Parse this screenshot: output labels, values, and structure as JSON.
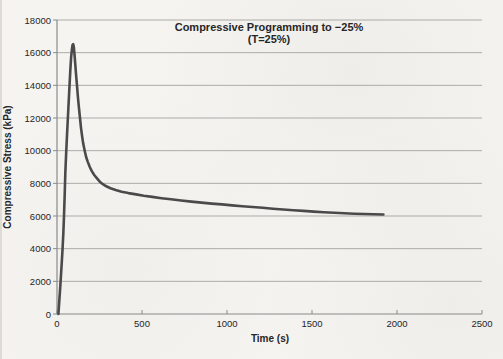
{
  "chart_data": {
    "type": "line",
    "title": "Compressive Programming to −25%",
    "subtitle": "(T=25%)",
    "xlabel": "Time (s)",
    "ylabel": "Compressive Stress (kPa)",
    "xlim": [
      0,
      2500
    ],
    "ylim": [
      0,
      18000
    ],
    "x_ticks": [
      0,
      500,
      1000,
      1500,
      2000,
      2500
    ],
    "y_ticks": [
      0,
      2000,
      4000,
      6000,
      8000,
      10000,
      12000,
      14000,
      16000,
      18000
    ],
    "grid": "horizontal-only",
    "legend": "none",
    "colors": {
      "line": "#4a4a4a",
      "grid": "#adaba8",
      "axis": "#8c8a87",
      "text": "#262626",
      "background": "#f5f4f1"
    },
    "series": [
      {
        "name": "compressive-stress",
        "peak": {
          "time_s": 95,
          "stress_kpa": 16520
        },
        "end": {
          "time_s": 1920,
          "stress_kpa": 6090
        },
        "points": [
          [
            8,
            0
          ],
          [
            14,
            900
          ],
          [
            20,
            1800
          ],
          [
            26,
            2800
          ],
          [
            32,
            3800
          ],
          [
            37,
            4900
          ],
          [
            41,
            6000
          ],
          [
            45,
            7300
          ],
          [
            49,
            8600
          ],
          [
            54,
            9900
          ],
          [
            60,
            11200
          ],
          [
            66,
            12400
          ],
          [
            72,
            13600
          ],
          [
            78,
            14900
          ],
          [
            83,
            15700
          ],
          [
            88,
            16250
          ],
          [
            92,
            16480
          ],
          [
            95,
            16520
          ],
          [
            99,
            16350
          ],
          [
            103,
            15900
          ],
          [
            107,
            15350
          ],
          [
            112,
            14700
          ],
          [
            117,
            14050
          ],
          [
            123,
            13300
          ],
          [
            129,
            12650
          ],
          [
            135,
            12000
          ],
          [
            141,
            11400
          ],
          [
            148,
            10850
          ],
          [
            155,
            10400
          ],
          [
            163,
            10000
          ],
          [
            172,
            9600
          ],
          [
            182,
            9300
          ],
          [
            193,
            9000
          ],
          [
            205,
            8750
          ],
          [
            220,
            8500
          ],
          [
            235,
            8300
          ],
          [
            252,
            8100
          ],
          [
            270,
            7950
          ],
          [
            290,
            7820
          ],
          [
            315,
            7700
          ],
          [
            345,
            7590
          ],
          [
            380,
            7490
          ],
          [
            420,
            7400
          ],
          [
            465,
            7320
          ],
          [
            510,
            7240
          ],
          [
            560,
            7170
          ],
          [
            615,
            7090
          ],
          [
            670,
            7020
          ],
          [
            730,
            6950
          ],
          [
            790,
            6880
          ],
          [
            850,
            6820
          ],
          [
            910,
            6760
          ],
          [
            970,
            6710
          ],
          [
            1030,
            6650
          ],
          [
            1090,
            6600
          ],
          [
            1150,
            6550
          ],
          [
            1210,
            6500
          ],
          [
            1270,
            6450
          ],
          [
            1330,
            6400
          ],
          [
            1390,
            6350
          ],
          [
            1450,
            6310
          ],
          [
            1510,
            6270
          ],
          [
            1570,
            6230
          ],
          [
            1630,
            6200
          ],
          [
            1690,
            6170
          ],
          [
            1750,
            6140
          ],
          [
            1810,
            6120
          ],
          [
            1860,
            6105
          ],
          [
            1920,
            6090
          ]
        ]
      }
    ]
  }
}
